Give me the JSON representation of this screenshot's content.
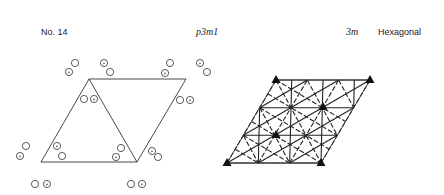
{
  "header": {
    "number": "No. 14",
    "symbol": "p3m1",
    "point_group": "3m",
    "crystal_system": "Hexagonal"
  },
  "left_diagram": {
    "description": "general positions",
    "cell": [
      [
        89,
        79
      ],
      [
        186,
        79
      ],
      [
        137,
        162
      ],
      [
        41,
        162
      ]
    ],
    "diagonal": [
      [
        89,
        79
      ],
      [
        137,
        162
      ]
    ],
    "circles": [
      {
        "x": 75,
        "y": 63,
        "dot": false
      },
      {
        "x": 69,
        "y": 72,
        "dot": true
      },
      {
        "x": 104,
        "y": 63,
        "dot": true
      },
      {
        "x": 110,
        "y": 72,
        "dot": false
      },
      {
        "x": 170,
        "y": 63,
        "dot": false
      },
      {
        "x": 165,
        "y": 73,
        "dot": true
      },
      {
        "x": 200,
        "y": 63,
        "dot": true
      },
      {
        "x": 207,
        "y": 72,
        "dot": false
      },
      {
        "x": 84,
        "y": 99,
        "dot": false
      },
      {
        "x": 94,
        "y": 99,
        "dot": true
      },
      {
        "x": 180,
        "y": 100,
        "dot": false
      },
      {
        "x": 190,
        "y": 100,
        "dot": true
      },
      {
        "x": 57,
        "y": 146,
        "dot": true
      },
      {
        "x": 62,
        "y": 156,
        "dot": false
      },
      {
        "x": 152,
        "y": 151,
        "dot": true
      },
      {
        "x": 158,
        "y": 157,
        "dot": false
      },
      {
        "x": 26,
        "y": 146,
        "dot": false
      },
      {
        "x": 20,
        "y": 156,
        "dot": true
      },
      {
        "x": 121,
        "y": 148,
        "dot": false
      },
      {
        "x": 116,
        "y": 157,
        "dot": true
      },
      {
        "x": 35,
        "y": 184,
        "dot": false
      },
      {
        "x": 47,
        "y": 184,
        "dot": true
      },
      {
        "x": 131,
        "y": 184,
        "dot": false
      },
      {
        "x": 142,
        "y": 184,
        "dot": true
      }
    ]
  },
  "right_diagram": {
    "description": "symmetry elements",
    "cell": [
      [
        276,
        80
      ],
      [
        370,
        80
      ],
      [
        321,
        163
      ],
      [
        227,
        163
      ]
    ],
    "triangles": [
      [
        276,
        80
      ],
      [
        370,
        80
      ],
      [
        323,
        107
      ],
      [
        276,
        135
      ],
      [
        227,
        163
      ],
      [
        321,
        163
      ]
    ]
  }
}
